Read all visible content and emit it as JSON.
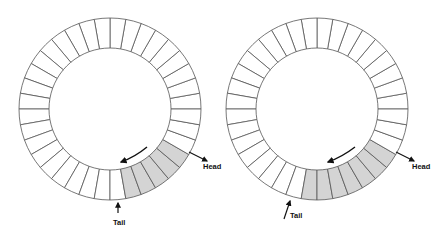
{
  "figure": {
    "colors": {
      "filled": "#d4d4d4",
      "empty": "#ffffff",
      "stroke": "#555555",
      "arrow": "#111111"
    }
  },
  "rings": [
    {
      "id": "left",
      "cx": 110,
      "cy": 109,
      "r_outer": 91,
      "r_inner": 61,
      "segments": 36,
      "filled_start_deg": 280,
      "filled_end_deg": 330,
      "filled_count": 5,
      "head_label": "Head",
      "tail_label": "Tail",
      "head_arrow": {
        "x1": 189,
        "y1": 152,
        "x2": 207,
        "y2": 161
      },
      "head_text": {
        "x": 203,
        "y": 169
      },
      "tail_arrow": {
        "x1": 118,
        "y1": 213,
        "x2": 118,
        "y2": 203
      },
      "tail_text": {
        "x": 113,
        "y": 225
      },
      "motion_arrow": {
        "d": "M147,147 Q135,157 121,162",
        "hx": 121,
        "hy": 162
      }
    },
    {
      "id": "right",
      "cx": 317,
      "cy": 109,
      "r_outer": 91,
      "r_inner": 61,
      "segments": 36,
      "filled_start_deg": 260,
      "filled_end_deg": 330,
      "filled_count": 7,
      "head_label": "Head",
      "tail_label": "Tail",
      "head_arrow": {
        "x1": 396,
        "y1": 152,
        "x2": 414,
        "y2": 161
      },
      "head_text": {
        "x": 412,
        "y": 169
      },
      "tail_arrow": {
        "x1": 284,
        "y1": 219,
        "x2": 290,
        "y2": 201
      },
      "tail_text": {
        "x": 290,
        "y": 218
      },
      "motion_arrow": {
        "d": "M355,147 Q342,157 328,162",
        "hx": 328,
        "hy": 162
      }
    }
  ]
}
